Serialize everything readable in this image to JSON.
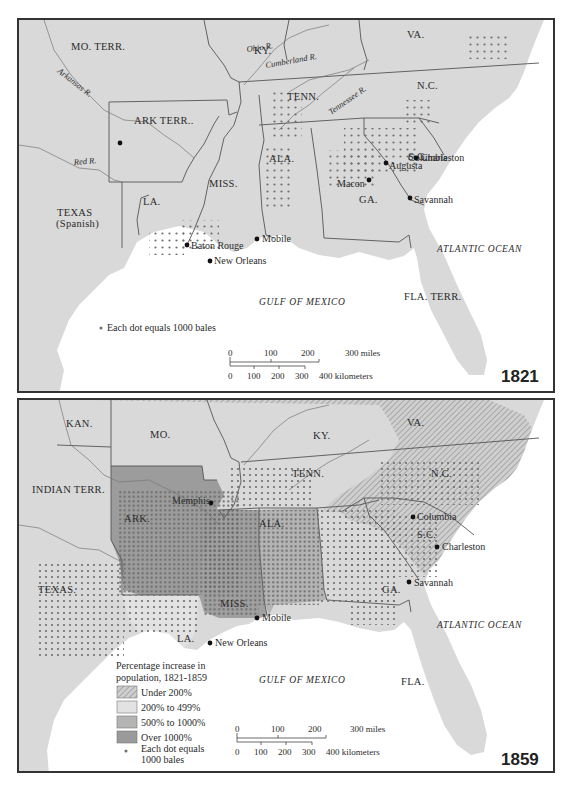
{
  "maps": [
    {
      "year": "1821",
      "states": {
        "mo": "MO. TERR.",
        "ky": "KY.",
        "va": "VA.",
        "ark": "ARK TERR..",
        "tenn": "TENN.",
        "nc": "N.C.",
        "miss": "MISS.",
        "ala": "ALA.",
        "sc": "S.C.",
        "ga": "GA.",
        "la": "LA.",
        "texas": "TEXAS",
        "texas_sub": "(Spanish)",
        "fla": "FLA. TERR."
      },
      "rivers": {
        "ohio": "Ohio R.",
        "cumberland": "Cumberland R.",
        "arkansas": "Arkansas R.",
        "tennessee": "Tennessee R.",
        "red": "Red R."
      },
      "cities": {
        "columbia": "Columbia",
        "charleston": "Charleston",
        "augusta": "Augusta",
        "macon": "Macon",
        "savannah": "Savannah",
        "mobile": "Mobile",
        "baton_rouge": "Baton Rouge",
        "new_orleans": "New Orleans"
      },
      "water": {
        "atlantic": "ATLANTIC OCEAN",
        "gulf": "GULF OF MEXICO"
      },
      "legend": {
        "dot": "Each dot equals 1000 bales"
      },
      "scale": {
        "miles": [
          "0",
          "100",
          "200",
          "300 miles"
        ],
        "km": [
          "0",
          "100",
          "200",
          "300",
          "400 kilometers"
        ]
      }
    },
    {
      "year": "1859",
      "states": {
        "kan": "KAN.",
        "mo": "MO.",
        "ky": "KY.",
        "va": "VA.",
        "indian": "INDIAN TERR.",
        "tenn": "TENN.",
        "nc": "N.C.",
        "ark": "ARK.",
        "ala": "ALA.",
        "sc": "S.C.",
        "texas": "TEXAS.",
        "ga": "GA.",
        "miss": "MISS.",
        "la": "LA.",
        "fla": "FLA."
      },
      "cities": {
        "memphis": "Memphis",
        "columbia": "Columbia",
        "charleston": "Charleston",
        "savannah": "Savannah",
        "mobile": "Mobile",
        "new_orleans": "New Orleans"
      },
      "water": {
        "atlantic": "ATLANTIC OCEAN",
        "gulf": "GULF OF MEXICO"
      },
      "legend": {
        "title_line1": "Percentage increase in",
        "title_line2": "population, 1821-1859",
        "items": [
          {
            "label": "Under 200%",
            "pattern": "hatched",
            "color": "#c8c8c8"
          },
          {
            "label": "200% to 499%",
            "color": "#e2e2e2"
          },
          {
            "label": "500% to 1000%",
            "color": "#b4b4b4"
          },
          {
            "label": "Over 1000%",
            "color": "#9a9a9a"
          }
        ],
        "dot_line1": "Each dot equals",
        "dot_line2": "1000 bales"
      },
      "scale": {
        "miles": [
          "0",
          "100",
          "200",
          "300 miles"
        ],
        "km": [
          "0",
          "100",
          "200",
          "300",
          "400 kilometers"
        ]
      }
    }
  ],
  "colors": {
    "land": "#d6d6d6",
    "water": "#ffffff",
    "border": "#555555",
    "dot": "#6e6e6e",
    "city": "#111111"
  }
}
